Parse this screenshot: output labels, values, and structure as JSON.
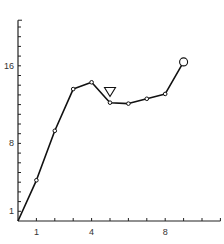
{
  "chart_data": {
    "type": "line",
    "title": "",
    "xlabel": "",
    "ylabel": "",
    "xlim": [
      0,
      11
    ],
    "ylim": [
      0,
      20.7
    ],
    "grid": false,
    "legend": null,
    "x_ticks": [
      1,
      2,
      3,
      4,
      5,
      6,
      7,
      8,
      9,
      10,
      11
    ],
    "x_tick_labels": [
      {
        "value": 1,
        "label": "1"
      },
      {
        "value": 4,
        "label": "4"
      },
      {
        "value": 8,
        "label": "8"
      }
    ],
    "y_ticks": [
      1,
      2,
      3,
      4,
      5,
      6,
      7,
      8,
      9,
      10,
      11,
      12,
      13,
      14,
      15,
      16,
      17,
      18,
      19,
      20
    ],
    "y_tick_labels": [
      {
        "value": 1,
        "label": "1"
      },
      {
        "value": 8,
        "label": "8"
      },
      {
        "value": 16,
        "label": "16"
      }
    ],
    "series": [
      {
        "name": "series-1",
        "x": [
          0,
          1,
          2,
          3,
          4,
          5,
          6,
          7,
          8,
          9
        ],
        "values": [
          0,
          4.2,
          9.3,
          13.6,
          14.3,
          12.2,
          12.1,
          12.6,
          13.1,
          16.4
        ],
        "marker": "small-open-circle",
        "last_marker": "large-open-circle"
      }
    ],
    "annotations": [
      {
        "type": "open-triangle-down",
        "x": 5,
        "y": 13.3,
        "description": "marker above point at x=5"
      }
    ]
  }
}
